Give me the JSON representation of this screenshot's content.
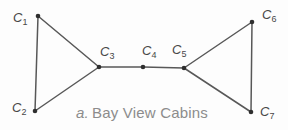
{
  "figure": {
    "caption": {
      "prefix": "a.",
      "title": "Bay View Cabins"
    }
  },
  "colors": {
    "background": "#fdfdfd",
    "edge": "#585858",
    "vertex_dot": "#2f2f2f",
    "vertex_label": "#474747",
    "caption": "#8c8c8c"
  },
  "graph": {
    "type": "undirected-graph",
    "vertex_count": 7,
    "vertices": [
      {
        "id": "C1",
        "label": "C",
        "subscript": "1",
        "x": 38,
        "y": 16,
        "label_x": 13,
        "label_y": 22
      },
      {
        "id": "C2",
        "label": "C",
        "subscript": "2",
        "x": 35,
        "y": 111,
        "label_x": 12,
        "label_y": 112
      },
      {
        "id": "C3",
        "label": "C",
        "subscript": "3",
        "x": 99,
        "y": 67,
        "label_x": 100,
        "label_y": 56
      },
      {
        "id": "C4",
        "label": "C",
        "subscript": "4",
        "x": 143,
        "y": 67,
        "label_x": 142,
        "label_y": 55
      },
      {
        "id": "C5",
        "label": "C",
        "subscript": "5",
        "x": 184,
        "y": 68,
        "label_x": 172,
        "label_y": 54
      },
      {
        "id": "C6",
        "label": "C",
        "subscript": "6",
        "x": 252,
        "y": 22,
        "label_x": 262,
        "label_y": 19
      },
      {
        "id": "C7",
        "label": "C",
        "subscript": "7",
        "x": 251,
        "y": 112,
        "label_x": 260,
        "label_y": 116
      }
    ],
    "edges": [
      {
        "from": "C1",
        "to": "C2"
      },
      {
        "from": "C1",
        "to": "C3"
      },
      {
        "from": "C2",
        "to": "C3"
      },
      {
        "from": "C3",
        "to": "C4"
      },
      {
        "from": "C4",
        "to": "C5"
      },
      {
        "from": "C5",
        "to": "C6"
      },
      {
        "from": "C5",
        "to": "C7"
      },
      {
        "from": "C6",
        "to": "C7"
      }
    ]
  }
}
